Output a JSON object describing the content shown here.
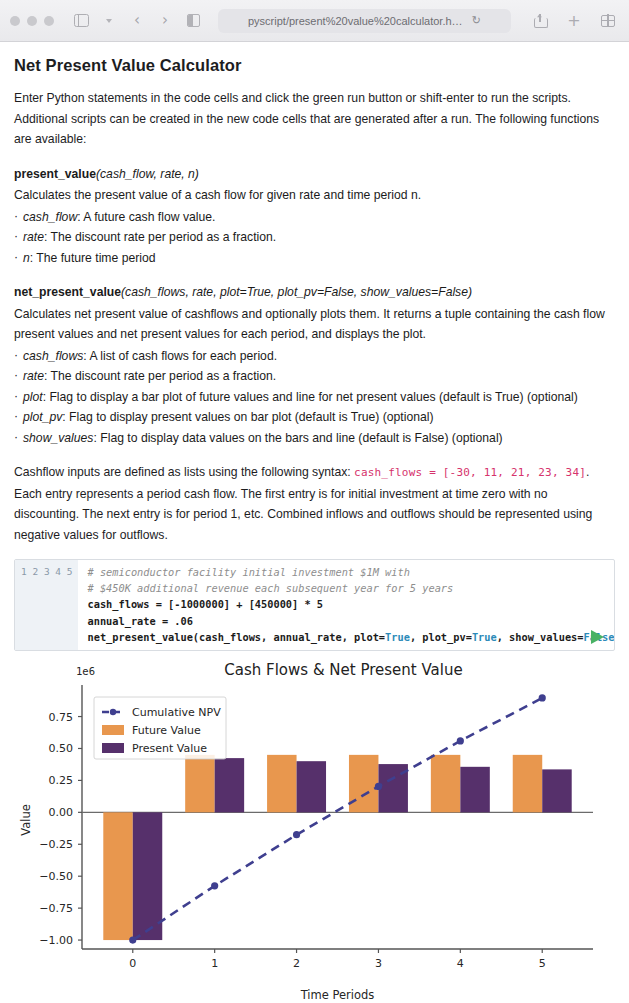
{
  "browser": {
    "url": "pyscript/present%20value%20calculator.html",
    "reload_glyph": "↻",
    "back_glyph": "‹",
    "forward_glyph": "›",
    "plus_glyph": "+"
  },
  "page": {
    "title": "Net Present Value Calculator",
    "intro": "Enter Python statements in the code cells and click the green run button or shift-enter to run the scripts. Additional scripts can be created in the new code cells that are generated after a run. The following functions are available:",
    "functions": [
      {
        "name": "present_value",
        "signature": "(cash_flow, rate, n)",
        "description": "Calculates the present value of a cash flow for given rate and time period n.",
        "args": [
          {
            "arg": "cash_flow",
            "text": ": A future cash flow value."
          },
          {
            "arg": "rate",
            "text": ": The discount rate per period as a fraction."
          },
          {
            "arg": "n",
            "text": ": The future time period"
          }
        ]
      },
      {
        "name": "net_present_value",
        "signature": "(cash_flows, rate, plot=True, plot_pv=False, show_values=False)",
        "description": "Calculates net present value of cashflows and optionally plots them. It returns a tuple containing the cash flow present values and net present values for each period, and displays the plot.",
        "args": [
          {
            "arg": "cash_flows",
            "text": ": A list of cash flows for each period."
          },
          {
            "arg": "rate",
            "text": ": The discount rate per period as a fraction."
          },
          {
            "arg": "plot",
            "text": ": Flag to display a bar plot of future values and line for net present values (default is True) (optional)"
          },
          {
            "arg": "plot_pv",
            "text": ": Flag to display present values on bar plot (default is True) (optional)"
          },
          {
            "arg": "show_values",
            "text": ": Flag to display data values on the bars and line (default is False) (optional)"
          }
        ]
      }
    ],
    "cashflow_note_pre": "Cashflow inputs are defined as lists using the following syntax: ",
    "cashflow_note_code": "cash_flows = [-30, 11, 21, 23, 34]",
    "cashflow_note_post": ". Each entry represents a period cash flow. The first entry is for initial investment at time zero with no discounting. The next entry is for period 1, etc. Combined inflows and outflows should be represented using negative values for outflows."
  },
  "code_cell": {
    "line_numbers": [
      "1",
      "2",
      "3",
      "4",
      "5"
    ],
    "lines": [
      "# semiconductor facility initial investment $1M with",
      "# $450K additional revenue each subsequent year for 5 years",
      "cash_flows = [-1000000] + [450000] * 5",
      "annual_rate = .06",
      "net_present_value(cash_flows, annual_rate, plot=True, plot_pv=True, show_values=False)"
    ],
    "run_label": "Run"
  },
  "chart_data": {
    "type": "bar",
    "title": "Cash Flows & Net Present Value",
    "xlabel": "Time Periods",
    "ylabel": "Value",
    "y_offset_text": "1e6",
    "categories": [
      0,
      1,
      2,
      3,
      4,
      5
    ],
    "xticks": [
      "0",
      "1",
      "2",
      "3",
      "4",
      "5"
    ],
    "yticks": [
      "0.75",
      "0.50",
      "0.25",
      "0.00",
      "−0.25",
      "−0.50",
      "−0.75",
      "−1.00"
    ],
    "ytick_values": [
      750000,
      500000,
      250000,
      0,
      -250000,
      -500000,
      -750000,
      -1000000
    ],
    "ylim": [
      -1070000,
      950000
    ],
    "grid": false,
    "legend_position": "upper left",
    "series": [
      {
        "name": "Cumulative NPV",
        "type": "line",
        "color": "#3f3f8f",
        "style": "dashed",
        "marker": "circle",
        "values": [
          -1000000,
          -575472,
          -174974,
          202855,
          559297,
          895563
        ]
      },
      {
        "name": "Future Value",
        "type": "bar",
        "color": "#e8974e",
        "values": [
          -1000000,
          450000,
          450000,
          450000,
          450000,
          450000
        ]
      },
      {
        "name": "Present Value",
        "type": "bar",
        "color": "#56306b",
        "values": [
          -1000000,
          424528,
          400498,
          377829,
          356442,
          336266
        ]
      }
    ]
  }
}
